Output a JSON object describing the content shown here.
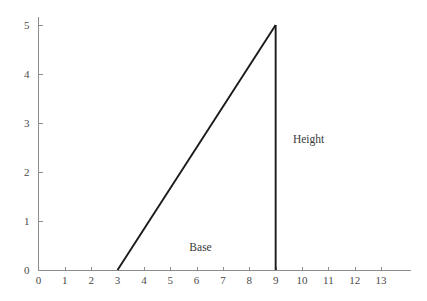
{
  "chart_data": {
    "type": "line",
    "title": "",
    "subtitle": "",
    "xlabel": "",
    "ylabel": "",
    "xlim": [
      0,
      13.4
    ],
    "ylim": [
      0,
      5.4
    ],
    "grid": false,
    "legend": null,
    "x_ticks": [
      0,
      1,
      2,
      3,
      4,
      5,
      6,
      7,
      8,
      9,
      10,
      11,
      12,
      13
    ],
    "x_tick_labels": [
      "0",
      "1",
      "2",
      "3",
      "4",
      "5",
      "6",
      "7",
      "8",
      "9",
      "10",
      "11",
      "12",
      "13"
    ],
    "y_ticks": [
      0,
      1,
      2,
      3,
      4,
      5
    ],
    "y_tick_labels": [
      "0",
      "1",
      "2",
      "3",
      "4",
      "5"
    ],
    "series": [
      {
        "name": "hypotenuse",
        "type": "line",
        "points": [
          [
            3,
            0
          ],
          [
            9,
            5
          ]
        ]
      },
      {
        "name": "height-leg",
        "type": "line",
        "points": [
          [
            9,
            0
          ],
          [
            9,
            5
          ]
        ]
      }
    ],
    "shape": {
      "kind": "right-triangle",
      "vertices": [
        [
          3,
          0
        ],
        [
          9,
          0
        ],
        [
          9,
          5
        ]
      ],
      "base_length": 6,
      "height_length": 5
    },
    "annotations": [
      {
        "text": "Base",
        "x": 6.15,
        "y": 0.38
      },
      {
        "text": "Height",
        "x": 10.25,
        "y": 2.6
      }
    ],
    "colors": {
      "background": "#ffffff",
      "axis": "#8c8c8c",
      "shape_stroke": "#1a1a1a",
      "tick_text": "#4a4a4a",
      "annotation_text": "#3a3a3a"
    }
  },
  "axes": {
    "x_axis_name": "x-axis",
    "y_axis_name": "y-axis"
  }
}
